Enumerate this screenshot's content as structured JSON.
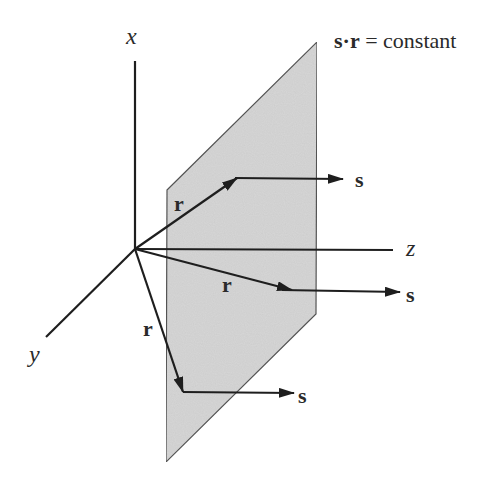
{
  "figure": {
    "title_equation": {
      "bold_part": "s·r",
      "rest": " = constant"
    },
    "axes": {
      "x_label": "x",
      "y_label": "y",
      "z_label": "z"
    },
    "vector_labels": {
      "position": "r",
      "direction": "s"
    },
    "colors": {
      "plane_fill": "#d6d6d6",
      "plane_edge": "#555555",
      "ink": "#1e1e1e"
    }
  }
}
